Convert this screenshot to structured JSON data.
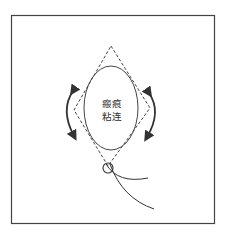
{
  "diagram": {
    "label_line1": "瘢痕",
    "label_line2": "粘连",
    "elements": {
      "frame": "border-box",
      "ellipse": "oval-structure",
      "diamond": "dashed-diamond-outline",
      "arrows": [
        "left-curved-double-arrow",
        "right-curved-double-arrow"
      ],
      "knot": "small-circle-knot",
      "threads": [
        "thread-upper",
        "thread-lower"
      ]
    },
    "colors": {
      "stroke": "#333333",
      "border": "#444444",
      "background": "#ffffff"
    }
  }
}
